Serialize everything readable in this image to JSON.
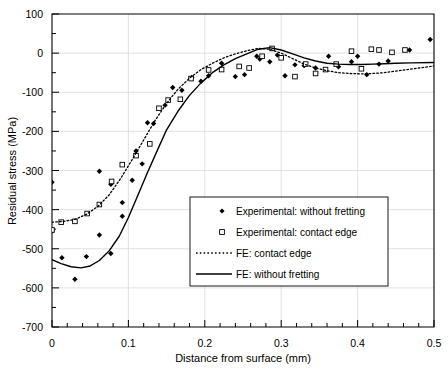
{
  "chart_data": {
    "type": "scatter",
    "title": "",
    "xlabel": "Distance from surface (mm)",
    "ylabel": "Residual stress (MPa)",
    "xlim": [
      0,
      0.5
    ],
    "ylim": [
      -700,
      100
    ],
    "xticks": [
      0,
      0.1,
      0.2,
      0.3,
      0.4,
      0.5
    ],
    "xtick_labels": [
      "0",
      "0.1",
      "0.2",
      "0.3",
      "0.4",
      "0.5"
    ],
    "yticks": [
      -700,
      -600,
      -500,
      -400,
      -300,
      -200,
      -100,
      0,
      100
    ],
    "ytick_labels": [
      "-700",
      "-600",
      "-500",
      "-400",
      "-300",
      "-200",
      "-100",
      "0",
      "100"
    ],
    "x_minor_tick_step": 0.02,
    "y_minor_tick_step": 50,
    "grid": true,
    "grid_color": "#d9d9d9",
    "legend_position": "lower-center-right",
    "series": [
      {
        "name": "Experimental: without fretting",
        "kind": "scatter",
        "marker": "filled-diamond",
        "color": "#000000",
        "points": [
          [
            0.0,
            -330
          ],
          [
            0.0,
            -455
          ],
          [
            0.013,
            -523
          ],
          [
            0.03,
            -578
          ],
          [
            0.045,
            -520
          ],
          [
            0.062,
            -465
          ],
          [
            0.062,
            -302
          ],
          [
            0.077,
            -512
          ],
          [
            0.077,
            -335
          ],
          [
            0.092,
            -382
          ],
          [
            0.092,
            -417
          ],
          [
            0.105,
            -325
          ],
          [
            0.11,
            -250
          ],
          [
            0.118,
            -283
          ],
          [
            0.125,
            -178
          ],
          [
            0.133,
            -180
          ],
          [
            0.148,
            -133
          ],
          [
            0.158,
            -88
          ],
          [
            0.17,
            -95
          ],
          [
            0.183,
            -62
          ],
          [
            0.195,
            -72
          ],
          [
            0.205,
            -58
          ],
          [
            0.222,
            -26
          ],
          [
            0.24,
            -60
          ],
          [
            0.252,
            -55
          ],
          [
            0.268,
            -8
          ],
          [
            0.272,
            -15
          ],
          [
            0.285,
            -22
          ],
          [
            0.295,
            -5
          ],
          [
            0.305,
            -58
          ],
          [
            0.318,
            -30
          ],
          [
            0.33,
            -32
          ],
          [
            0.345,
            -38
          ],
          [
            0.362,
            -8
          ],
          [
            0.375,
            -35
          ],
          [
            0.392,
            -22
          ],
          [
            0.4,
            -8
          ],
          [
            0.412,
            -55
          ],
          [
            0.428,
            -28
          ],
          [
            0.44,
            -20
          ],
          [
            0.468,
            8
          ],
          [
            0.495,
            35
          ]
        ]
      },
      {
        "name": "Experimental: contact edge",
        "kind": "scatter",
        "marker": "open-square",
        "color": "#000000",
        "points": [
          [
            0.0,
            -452
          ],
          [
            0.012,
            -432
          ],
          [
            0.03,
            -430
          ],
          [
            0.046,
            -410
          ],
          [
            0.062,
            -387
          ],
          [
            0.078,
            -328
          ],
          [
            0.092,
            -285
          ],
          [
            0.11,
            -262
          ],
          [
            0.128,
            -232
          ],
          [
            0.14,
            -141
          ],
          [
            0.152,
            -120
          ],
          [
            0.168,
            -118
          ],
          [
            0.182,
            -65
          ],
          [
            0.205,
            -43
          ],
          [
            0.222,
            -42
          ],
          [
            0.245,
            -34
          ],
          [
            0.258,
            -38
          ],
          [
            0.275,
            -8
          ],
          [
            0.288,
            12
          ],
          [
            0.3,
            -12
          ],
          [
            0.318,
            -60
          ],
          [
            0.332,
            -28
          ],
          [
            0.345,
            -52
          ],
          [
            0.358,
            -42
          ],
          [
            0.372,
            -28
          ],
          [
            0.392,
            5
          ],
          [
            0.405,
            -40
          ],
          [
            0.418,
            10
          ],
          [
            0.428,
            8
          ],
          [
            0.445,
            2
          ],
          [
            0.462,
            8
          ]
        ]
      },
      {
        "name": "FE: contact edge",
        "kind": "line",
        "style": "dotted",
        "color": "#000000",
        "points": [
          [
            0.0,
            -432
          ],
          [
            0.015,
            -430
          ],
          [
            0.03,
            -425
          ],
          [
            0.045,
            -412
          ],
          [
            0.06,
            -392
          ],
          [
            0.075,
            -362
          ],
          [
            0.09,
            -320
          ],
          [
            0.105,
            -272
          ],
          [
            0.12,
            -222
          ],
          [
            0.135,
            -172
          ],
          [
            0.15,
            -128
          ],
          [
            0.165,
            -92
          ],
          [
            0.18,
            -64
          ],
          [
            0.195,
            -42
          ],
          [
            0.21,
            -26
          ],
          [
            0.225,
            -12
          ],
          [
            0.24,
            -2
          ],
          [
            0.255,
            6
          ],
          [
            0.27,
            12
          ],
          [
            0.285,
            10
          ],
          [
            0.3,
            0
          ],
          [
            0.315,
            -14
          ],
          [
            0.33,
            -28
          ],
          [
            0.345,
            -38
          ],
          [
            0.36,
            -45
          ],
          [
            0.375,
            -50
          ],
          [
            0.39,
            -52
          ],
          [
            0.405,
            -53
          ],
          [
            0.42,
            -52
          ],
          [
            0.435,
            -50
          ],
          [
            0.45,
            -46
          ],
          [
            0.465,
            -42
          ],
          [
            0.48,
            -38
          ],
          [
            0.5,
            -33
          ]
        ]
      },
      {
        "name": "FE: without fretting",
        "kind": "line",
        "style": "solid",
        "color": "#000000",
        "points": [
          [
            0.0,
            -528
          ],
          [
            0.012,
            -538
          ],
          [
            0.025,
            -546
          ],
          [
            0.038,
            -549
          ],
          [
            0.05,
            -544
          ],
          [
            0.062,
            -530
          ],
          [
            0.075,
            -505
          ],
          [
            0.088,
            -468
          ],
          [
            0.1,
            -420
          ],
          [
            0.112,
            -365
          ],
          [
            0.125,
            -305
          ],
          [
            0.138,
            -248
          ],
          [
            0.15,
            -196
          ],
          [
            0.165,
            -148
          ],
          [
            0.18,
            -108
          ],
          [
            0.195,
            -76
          ],
          [
            0.21,
            -50
          ],
          [
            0.225,
            -30
          ],
          [
            0.24,
            -14
          ],
          [
            0.255,
            -2
          ],
          [
            0.27,
            10
          ],
          [
            0.285,
            14
          ],
          [
            0.3,
            8
          ],
          [
            0.315,
            -2
          ],
          [
            0.33,
            -12
          ],
          [
            0.345,
            -20
          ],
          [
            0.36,
            -26
          ],
          [
            0.375,
            -28
          ],
          [
            0.39,
            -29
          ],
          [
            0.405,
            -29
          ],
          [
            0.42,
            -28
          ],
          [
            0.435,
            -27
          ],
          [
            0.45,
            -26
          ],
          [
            0.47,
            -25
          ],
          [
            0.5,
            -24
          ]
        ]
      }
    ],
    "legend_entries": [
      {
        "label": "Experimental: without fretting",
        "marker": "filled-diamond"
      },
      {
        "label": "Experimental: contact edge",
        "marker": "open-square"
      },
      {
        "label": "FE: contact edge",
        "marker": "dotted-line"
      },
      {
        "label": "FE: without fretting",
        "marker": "solid-line"
      }
    ]
  }
}
